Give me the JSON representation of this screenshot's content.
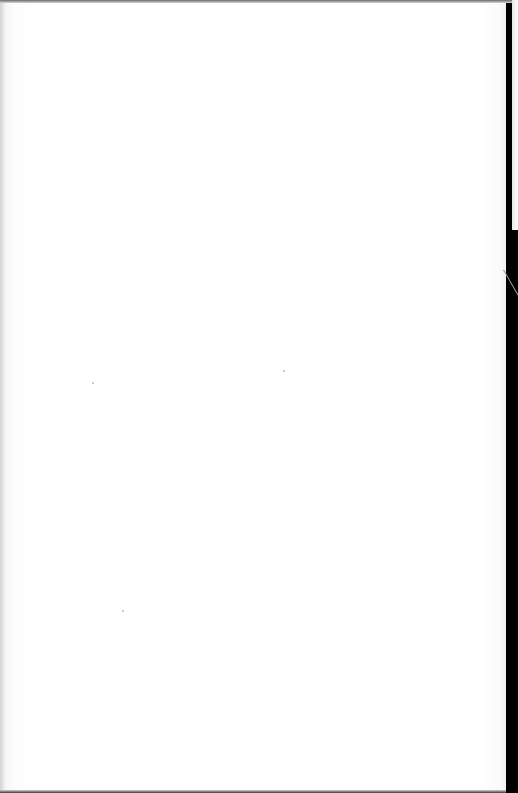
{
  "document": {
    "type": "scanned-page",
    "blank": true,
    "text_content": "",
    "colors": {
      "paper": "#ffffff",
      "scan_border": "#000000",
      "edge_shadow": "#e0e0e0"
    }
  }
}
